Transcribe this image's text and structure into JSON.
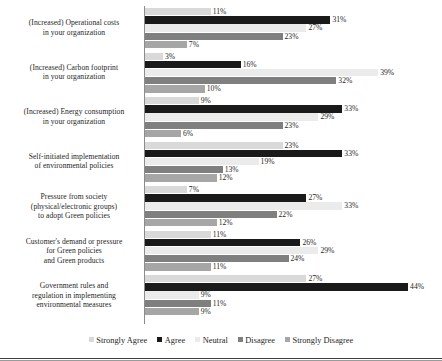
{
  "chart_data": {
    "type": "bar",
    "orientation": "horizontal",
    "title": "",
    "xlabel": "",
    "ylabel": "",
    "xlim": [
      0,
      50
    ],
    "grid": false,
    "legend_position": "bottom",
    "value_suffix": "%",
    "categories": [
      "(Increased) Operational costs\nin your organization",
      "(Increased) Carbon footprint\nin your organization",
      "(Increased) Energy consumption\nin your organization",
      "Self-initiated implementation\nof environmental policies",
      "Pressure from society\n(physical/electronic groups)\nto adopt Green policies",
      "Customer's demand or pressure\nfor Green policies\nand Green products",
      "Government rules and\nregulation in implementing\nenvironmental measures"
    ],
    "series": [
      {
        "name": "Strongly Agree",
        "color": "#d9d9d9",
        "values": [
          11,
          3,
          9,
          23,
          7,
          11,
          27
        ],
        "labels": [
          "11%",
          "3%",
          "9%",
          "23%",
          "7%",
          "11%",
          "27%"
        ]
      },
      {
        "name": "Agree",
        "color": "#1a1a1a",
        "values": [
          31,
          16,
          33,
          33,
          27,
          26,
          44
        ],
        "labels": [
          "31%",
          "16%",
          "33%",
          "33%",
          "27%",
          "26%",
          "44%"
        ]
      },
      {
        "name": "Neutral",
        "color": "#ebebeb",
        "values": [
          27,
          39,
          29,
          19,
          33,
          29,
          9
        ],
        "labels": [
          "27%",
          "39%",
          "29%",
          "19%",
          "33%",
          "29%",
          "9%"
        ]
      },
      {
        "name": "Disagree",
        "color": "#7f7f7f",
        "values": [
          23,
          32,
          23,
          13,
          22,
          24,
          11
        ],
        "labels": [
          "23%",
          "32%",
          "23%",
          "13%",
          "22%",
          "24%",
          "11%"
        ]
      },
      {
        "name": "Strongly Disagree",
        "color": "#a6a6a6",
        "values": [
          7,
          10,
          6,
          12,
          12,
          11,
          9
        ],
        "labels": [
          "7%",
          "10%",
          "6%",
          "12%",
          "12%",
          "11%",
          "9%"
        ]
      }
    ]
  },
  "legend": {
    "items": [
      {
        "label": "Strongly Agree",
        "color": "#d9d9d9"
      },
      {
        "label": "Agree",
        "color": "#1a1a1a"
      },
      {
        "label": "Neutral",
        "color": "#ebebeb"
      },
      {
        "label": "Disagree",
        "color": "#7f7f7f"
      },
      {
        "label": "Strongly Disagree",
        "color": "#a6a6a6"
      }
    ]
  },
  "scale": {
    "px_per_percent": 5.98
  }
}
